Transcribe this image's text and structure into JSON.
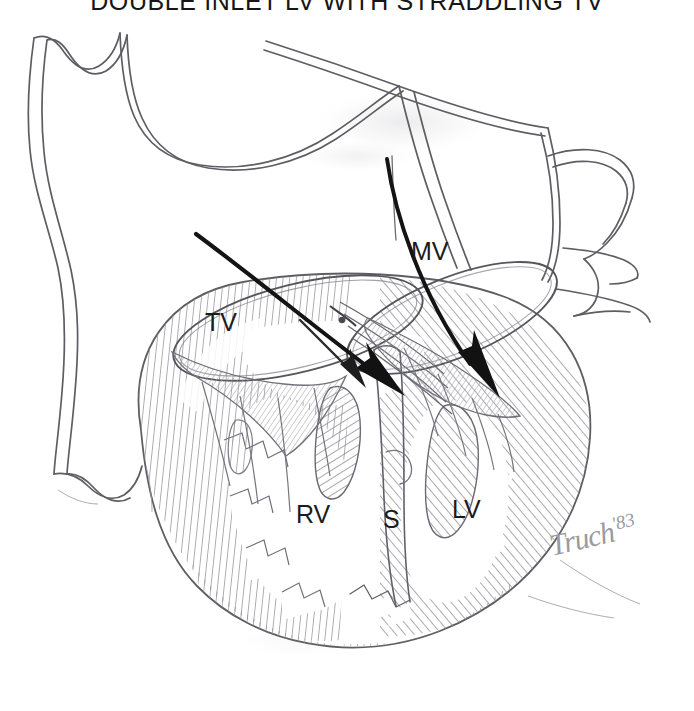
{
  "figure": {
    "title": "DOUBLE INLET LV WITH STRADDLING TV",
    "domain_note": "pencil line drawing of a congenitally malformed heart in four-chamber section",
    "medium": "graphite pencil sketch on white paper",
    "signature": {
      "artist_mark": "Truch",
      "year": "'83"
    }
  },
  "labels": {
    "tv": "TV",
    "mv": "MV",
    "rv": "RV",
    "s": "S",
    "lv": "LV"
  },
  "label_meanings": {
    "tv": "tricuspid valve",
    "mv": "mitral valve",
    "rv": "rudimentary right ventricle",
    "s": "septum",
    "lv": "left ventricle"
  },
  "colors": {
    "paper": "#ffffff",
    "outline": "#5a5a60",
    "outline_dark": "#3d3d43",
    "hatch": "#8d8d92",
    "hatch_light": "#a9a9ae",
    "arrow": "#1a1a1a",
    "title_text": "#161616",
    "label_text": "#1b1b1b",
    "signature": "#9a9a9f"
  },
  "flow_arrows": [
    {
      "name": "tricuspid-inflow-arrow",
      "description": "straddling tricuspid inflow crossing the septum into the left ventricle"
    },
    {
      "name": "mitral-inflow-arrow",
      "description": "mitral inflow descending into the left ventricle"
    }
  ],
  "structures": [
    "common atrium",
    "atrial appendage",
    "tricuspid valve annulus",
    "mitral valve annulus",
    "straddling tricuspid chordae",
    "ventricular mass",
    "trabeculated myocardium",
    "rudimentary right ventricle",
    "left ventricle",
    "interventricular septum",
    "papillary muscle"
  ]
}
